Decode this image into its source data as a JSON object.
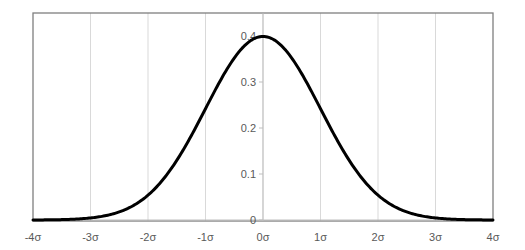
{
  "chart_data": {
    "type": "line",
    "title": "",
    "xlabel": "",
    "ylabel": "",
    "series": [
      {
        "name": "Standard normal probability density",
        "function": "pdf(x) = exp(-x^2/2)/sqrt(2*pi)",
        "x": [
          -4,
          -3.5,
          -3,
          -2.5,
          -2,
          -1.5,
          -1,
          -0.5,
          0,
          0.5,
          1,
          1.5,
          2,
          2.5,
          3,
          3.5,
          4
        ],
        "values": [
          0.0001,
          0.0009,
          0.0044,
          0.0175,
          0.054,
          0.1295,
          0.242,
          0.3521,
          0.3989,
          0.3521,
          0.242,
          0.1295,
          0.054,
          0.0175,
          0.0044,
          0.0009,
          0.0001
        ],
        "color": "#000000"
      }
    ],
    "x_ticks": [
      "-4σ",
      "-3σ",
      "-2σ",
      "-1σ",
      "0σ",
      "1σ",
      "2σ",
      "3σ",
      "4σ"
    ],
    "y_ticks": [
      "0",
      "0.1",
      "0.2",
      "0.3",
      "0.4"
    ],
    "xlim": [
      -4,
      4
    ],
    "ylim": [
      0,
      0.45
    ],
    "grid": {
      "vertical": true,
      "horizontal": false,
      "color": "#d9d9d9"
    },
    "legend": null,
    "y_axis_position": "x=0"
  },
  "colors": {
    "curve": "#000000",
    "frame": "#7f7f7f",
    "grid": "#d9d9d9",
    "axis": "#a6a6a6",
    "labels": "#595959"
  }
}
